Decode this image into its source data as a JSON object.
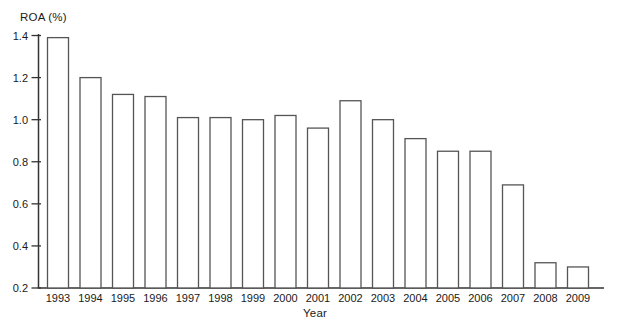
{
  "figure": {
    "y_axis_title": "ROA (%)",
    "x_axis_title": "Year"
  },
  "chart_data": {
    "type": "bar",
    "title": "",
    "xlabel": "Year",
    "ylabel": "ROA (%)",
    "categories": [
      "1993",
      "1994",
      "1995",
      "1996",
      "1997",
      "1998",
      "1999",
      "2000",
      "2001",
      "2002",
      "2003",
      "2004",
      "2005",
      "2006",
      "2007",
      "2008",
      "2009"
    ],
    "values": [
      1.39,
      1.2,
      1.12,
      1.11,
      1.01,
      1.01,
      1.0,
      1.02,
      0.96,
      1.09,
      1.0,
      0.91,
      0.85,
      0.85,
      0.69,
      0.32,
      0.3
    ],
    "ylim": [
      0.2,
      1.4
    ],
    "ytick_step": 0.2,
    "ytick_labels": [
      "1.4",
      "1.2",
      "1.0",
      "0.8",
      "0.6",
      "0.4",
      "0.2"
    ],
    "grid": false,
    "legend": null,
    "bar_fill": "#ffffff",
    "bar_stroke": "#555555",
    "axis_color": "#333333",
    "text_color": "#1a1a1a"
  }
}
